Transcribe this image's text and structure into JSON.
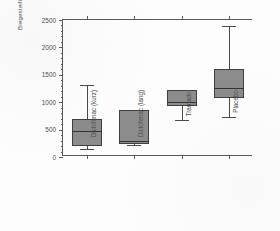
{
  "chart_data": {
    "type": "box",
    "title": "",
    "xlabel": "",
    "ylabel": "Biegesteifigkeit [Nmm/mm]",
    "ylim": [
      0,
      2500
    ],
    "ytick_labels": [
      "0",
      "500",
      "1000",
      "1500",
      "2000",
      "2500"
    ],
    "ytick_values": [
      0,
      500,
      1000,
      1500,
      2000,
      2500
    ],
    "yminor_step": 100,
    "grid": false,
    "legend": "none",
    "categories": [
      "Diclofenac (kurz)",
      "Diclofenac (lang)",
      "Tramadol",
      "Placebo"
    ],
    "boxes": [
      {
        "category": "Diclofenac (kurz)",
        "whisker_low": 155,
        "q1": 195,
        "median": 470,
        "q3": 700,
        "whisker_high": 1320
      },
      {
        "category": "Diclofenac (lang)",
        "whisker_low": 215,
        "q1": 230,
        "median": 290,
        "q3": 855,
        "whisker_high": 865
      },
      {
        "category": "Tramadol",
        "whisker_low": 680,
        "q1": 930,
        "median": 1000,
        "q3": 1220,
        "whisker_high": 1230
      },
      {
        "category": "Placebo",
        "whisker_low": 730,
        "q1": 1080,
        "median": 1260,
        "q3": 1610,
        "whisker_high": 2390
      }
    ],
    "colors": {
      "box_fill": "#8c8c8c",
      "box_edge": "#3f3f3f",
      "median_line": "#333333",
      "whisker": "#4a4a4a",
      "axis": "#5a5a5a",
      "text": "#4d4d4d",
      "background": "#fdfdfd"
    }
  }
}
